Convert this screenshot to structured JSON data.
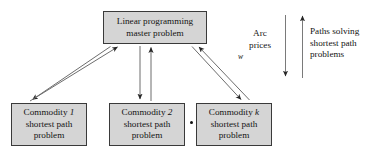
{
  "diagram": {
    "nodes": {
      "master": {
        "line1": "Linear programming",
        "line2": "master problem"
      },
      "commodity1": {
        "line1_prefix": "Commodity ",
        "line1_symbol": "1",
        "line2": "shortest path",
        "line3": "problem"
      },
      "commodity2": {
        "line1_prefix": "Commodity ",
        "line1_symbol": "2",
        "line2": "shortest path",
        "line3": "problem"
      },
      "commodityk": {
        "line1_prefix": "Commodity ",
        "line1_symbol": "k",
        "line2": "shortest path",
        "line3": "problem"
      }
    },
    "ellipsis": "•••",
    "annotations": {
      "arc_prices": {
        "line1": "Arc",
        "line2": "prices",
        "line3": "w"
      },
      "paths": {
        "line1": "Paths solving",
        "line2": "shortest path",
        "line3": "problems"
      }
    },
    "colors": {
      "box_fill": "#d5d5d5",
      "box_border": "#3a3a3a",
      "arrow": "#4d4d4d",
      "text": "#141414",
      "background": "#ffffff"
    }
  }
}
